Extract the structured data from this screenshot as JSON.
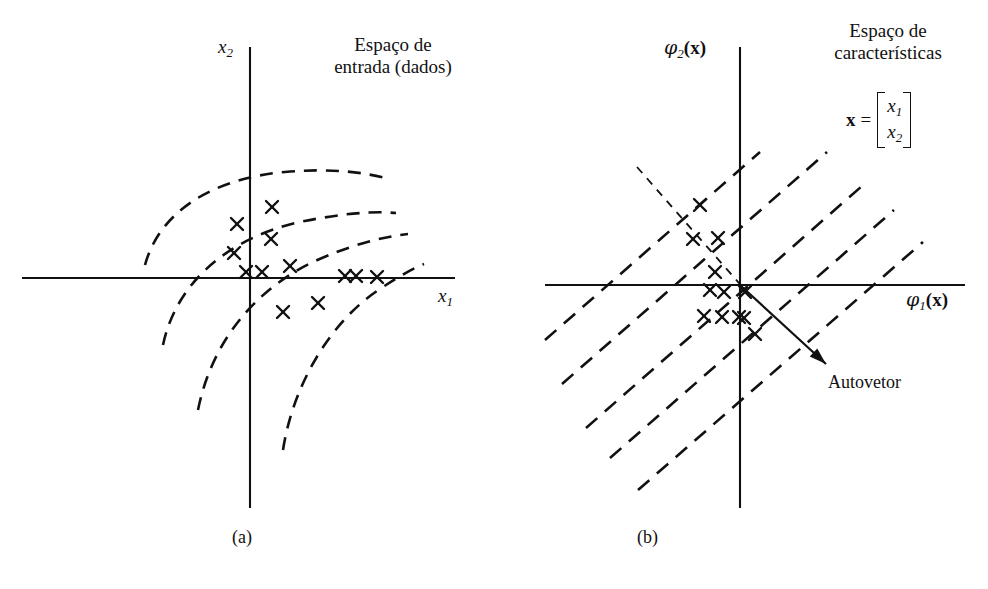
{
  "figure": {
    "background_color": "#ffffff",
    "ink_color": "#111111",
    "width": 988,
    "height": 589
  },
  "panel_a": {
    "caption": "(a)",
    "caption_pos": [
      240,
      537
    ],
    "title_line1": "Espaço de",
    "title_line2": "entrada (dados)",
    "title_pos": [
      388,
      34
    ],
    "y_axis_label": "x",
    "y_axis_sub": "2",
    "y_axis_label_pos": [
      224,
      35
    ],
    "x_axis_label": "x",
    "x_axis_sub": "1",
    "x_axis_label_pos": [
      469,
      285
    ],
    "axes": {
      "origin": [
        250,
        278
      ],
      "x_axis": [
        22,
        278,
        455,
        278
      ],
      "y_axis": [
        250,
        47,
        250,
        508
      ]
    },
    "contour_type": "curved-arcs",
    "contours": [
      {
        "name": "arc-1",
        "path": "M 145,265 C 160,210 215,178 285,172 C 330,168 362,172 385,178"
      },
      {
        "name": "arc-2",
        "path": "M 163,345 C 176,283 228,238 300,222 C 343,213 375,211 396,213"
      },
      {
        "name": "arc-3",
        "path": "M 198,410 C 212,340 258,285 322,258 C 362,241 390,236 408,234"
      },
      {
        "name": "arc-4",
        "path": "M 283,450 C 293,385 330,323 377,291 C 399,276 414,268 424,264"
      }
    ],
    "points": [
      [
        272,
        207
      ],
      [
        237,
        224
      ],
      [
        271,
        239
      ],
      [
        234,
        253
      ],
      [
        290,
        266
      ],
      [
        246,
        272
      ],
      [
        345,
        276
      ],
      [
        377,
        277
      ],
      [
        318,
        303
      ],
      [
        283,
        312
      ],
      [
        262,
        272
      ],
      [
        356,
        276
      ]
    ],
    "point_marker": "x"
  },
  "panel_b": {
    "caption": "(b)",
    "caption_pos": [
      645,
      537
    ],
    "title_line1": "Espaço de",
    "title_line2": "características",
    "title_pos": [
      882,
      20
    ],
    "y_axis_label_phi": "φ",
    "y_axis_sub": "2",
    "y_axis_arg": "(x)",
    "y_axis_label_pos": [
      676,
      35
    ],
    "x_axis_label_phi": "φ",
    "x_axis_sub": "1",
    "x_axis_arg": "(x)",
    "x_axis_label_pos": [
      930,
      288
    ],
    "vector_annotation": "Autovetor",
    "vector_annotation_pos": [
      833,
      382
    ],
    "matrix_note": {
      "lhs": "x",
      "equals": "=",
      "row1": "x",
      "row1_sub": "1",
      "row2": "x",
      "row2_sub": "2"
    },
    "matrix_note_pos": [
      849,
      92
    ],
    "axes": {
      "origin": [
        740,
        285
      ],
      "x_axis": [
        545,
        285,
        965,
        285
      ],
      "y_axis": [
        740,
        47,
        740,
        508
      ]
    },
    "contour_type": "parallel-lines",
    "contour_slope_deg": 45,
    "contours": [
      {
        "name": "line-1",
        "x1": 545,
        "y1": 340,
        "x2": 760,
        "y2": 152
      },
      {
        "name": "line-2",
        "x1": 562,
        "y1": 384,
        "x2": 827,
        "y2": 152
      },
      {
        "name": "line-3",
        "x1": 586,
        "y1": 428,
        "x2": 862,
        "y2": 186
      },
      {
        "name": "line-4",
        "x1": 610,
        "y1": 458,
        "x2": 894,
        "y2": 210
      },
      {
        "name": "line-5",
        "x1": 638,
        "y1": 490,
        "x2": 923,
        "y2": 242
      }
    ],
    "perpendicular_line": {
      "name": "perp-line",
      "x1": 637,
      "y1": 167,
      "x2": 745,
      "y2": 290
    },
    "eigenvector_arrow": {
      "x1": 740,
      "y1": 285,
      "x2": 826,
      "y2": 364
    },
    "points": [
      [
        700,
        205
      ],
      [
        693,
        239
      ],
      [
        718,
        238
      ],
      [
        715,
        272
      ],
      [
        724,
        292
      ],
      [
        745,
        292
      ],
      [
        704,
        316
      ],
      [
        722,
        317
      ],
      [
        739,
        317
      ],
      [
        744,
        318
      ],
      [
        755,
        334
      ],
      [
        710,
        290
      ]
    ],
    "point_marker": "x"
  }
}
